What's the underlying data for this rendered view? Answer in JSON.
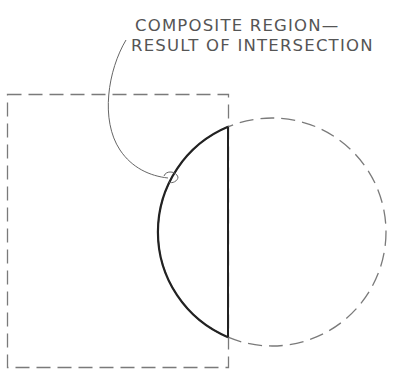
{
  "annotation": {
    "line1": "COMPOSITE REGION—",
    "line2": "RESULT OF INTERSECTION"
  },
  "shapes": {
    "rectangle": {
      "x": 7,
      "y": 94,
      "width": 221,
      "height": 274,
      "style": "dashed",
      "stroke": "#7a7a7a"
    },
    "circle": {
      "cx": 272,
      "cy": 232,
      "r": 114,
      "style": "dashed",
      "stroke": "#7a7a7a"
    },
    "composite_region": {
      "style": "solid-bold",
      "stroke": "#222222",
      "chord_x": 228
    }
  },
  "colors": {
    "background": "#ffffff",
    "dashed_line": "#7a7a7a",
    "bold_line": "#222222",
    "leader_line": "#666666",
    "text": "#555555"
  }
}
